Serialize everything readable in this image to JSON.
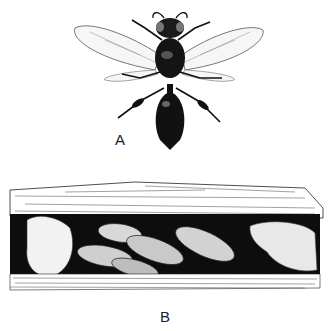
{
  "figure": {
    "panels": [
      {
        "id": "A",
        "label": "A",
        "subject": "wasp-dorsal-view"
      },
      {
        "id": "B",
        "label": "B",
        "subject": "nest-cells-in-wood-cavity"
      }
    ]
  },
  "colors": {
    "ink": "#111111",
    "paper": "#ffffff",
    "gray": "#8a8a8a"
  }
}
